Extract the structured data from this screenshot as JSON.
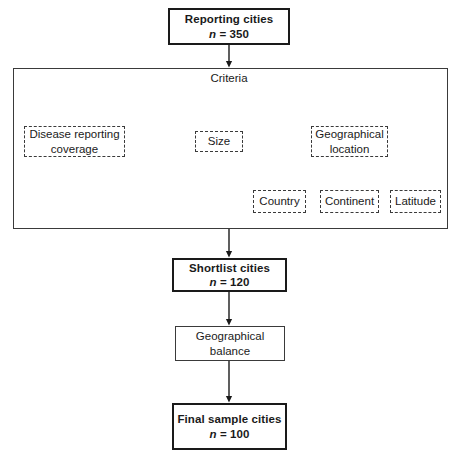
{
  "diagram": {
    "colors": {
      "background": "#ffffff",
      "stroke": "#1a1a1a",
      "light_stroke": "#3a3a3a"
    },
    "nodes": {
      "reporting_cities": {
        "label": "Reporting cities",
        "n_symbol": "n",
        "n_value": "= 350"
      },
      "criteria_group": {
        "label": "Criteria"
      },
      "disease_reporting": {
        "label": "Disease reporting coverage"
      },
      "size": {
        "label": "Size"
      },
      "geographical_location": {
        "label": "Geographical location"
      },
      "country": {
        "label": "Country"
      },
      "continent": {
        "label": "Continent"
      },
      "latitude": {
        "label": "Latitude"
      },
      "shortlist_cities": {
        "label": "Shortlist cities",
        "n_symbol": "n",
        "n_value": "= 120"
      },
      "geographical_balance": {
        "label": "Geographical balance"
      },
      "final_sample": {
        "label": "Final sample cities",
        "n_symbol": "n",
        "n_value": "= 100"
      }
    }
  }
}
